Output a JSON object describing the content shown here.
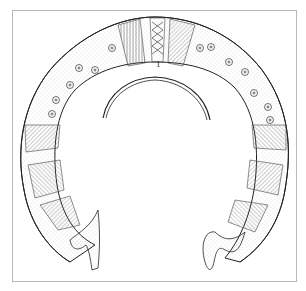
{
  "figure": {
    "section_label": "1",
    "colors": {
      "ink": "#222222",
      "frame": "#b8b8b8",
      "background": "#ffffff",
      "hatch": "#555555"
    }
  }
}
